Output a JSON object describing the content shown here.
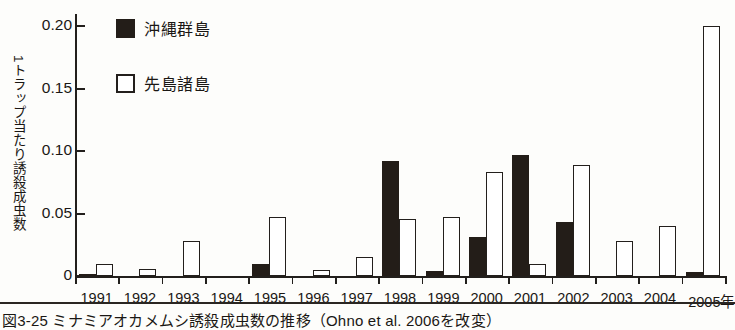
{
  "chart_data": {
    "type": "bar",
    "title": "",
    "xlabel": "",
    "ylabel": "1トラップ当たり誘殺成虫数",
    "x_axis_unit_suffix": "年",
    "categories": [
      "1991",
      "1992",
      "1993",
      "1994",
      "1995",
      "1996",
      "1997",
      "1998",
      "1999",
      "2000",
      "2001",
      "2002",
      "2003",
      "2004",
      "2005"
    ],
    "ylim": [
      0,
      0.21
    ],
    "yticks": [
      0,
      0.05,
      0.1,
      0.15,
      0.2
    ],
    "ytick_labels": [
      "0",
      "0.05",
      "0.10",
      "0.15",
      "0.20"
    ],
    "grid": false,
    "legend_position": "top-left",
    "series": [
      {
        "name": "沖縄群島",
        "color": "#231d18",
        "style": "filled",
        "values": [
          0.002,
          0,
          0,
          0,
          0.01,
          0,
          0,
          0.092,
          0.004,
          0.031,
          0.097,
          0.043,
          0,
          0,
          0.003
        ]
      },
      {
        "name": "先島諸島",
        "color": "#ffffff",
        "style": "outline",
        "values": [
          0.01,
          0.006,
          0.028,
          0,
          0.047,
          0.005,
          0.015,
          0.046,
          0.047,
          0.083,
          0.01,
          0.089,
          0.028,
          0.04,
          0.2
        ]
      }
    ]
  },
  "legend": {
    "items": [
      {
        "label": "沖縄群島",
        "swatch": "filled-black-square"
      },
      {
        "label": "先島諸島",
        "swatch": "outline-white-square"
      }
    ]
  },
  "caption": {
    "text": "図3-25 ミナミアオカメムシ誘殺成虫数の推移（Ohno et al. 2006を改変）"
  }
}
